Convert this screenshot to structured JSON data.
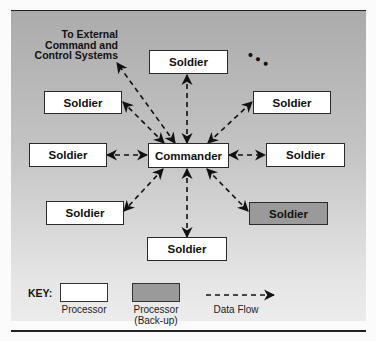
{
  "diagram": {
    "external_label_lines": [
      "To External",
      "Command and",
      "Control Systems"
    ],
    "ellipsis": "• • •",
    "nodes": {
      "commander": {
        "label": "Commander",
        "type": "processor"
      },
      "top": {
        "label": "Soldier",
        "type": "processor"
      },
      "upper_left": {
        "label": "Soldier",
        "type": "processor"
      },
      "upper_right": {
        "label": "Soldier",
        "type": "processor"
      },
      "left": {
        "label": "Soldier",
        "type": "processor"
      },
      "right": {
        "label": "Soldier",
        "type": "processor"
      },
      "lower_left": {
        "label": "Soldier",
        "type": "processor"
      },
      "lower_right": {
        "label": "Soldier",
        "type": "processor-backup"
      },
      "bottom": {
        "label": "Soldier",
        "type": "processor"
      }
    },
    "edges": [
      {
        "from": "commander",
        "to": "external-systems",
        "style": "dashed",
        "direction": "bidirectional"
      },
      {
        "from": "commander",
        "to": "top",
        "style": "dashed",
        "direction": "bidirectional"
      },
      {
        "from": "commander",
        "to": "upper_left",
        "style": "dashed",
        "direction": "bidirectional"
      },
      {
        "from": "commander",
        "to": "upper_right",
        "style": "dashed",
        "direction": "bidirectional"
      },
      {
        "from": "commander",
        "to": "left",
        "style": "dashed",
        "direction": "bidirectional"
      },
      {
        "from": "commander",
        "to": "right",
        "style": "dashed",
        "direction": "bidirectional"
      },
      {
        "from": "commander",
        "to": "lower_left",
        "style": "dashed",
        "direction": "bidirectional"
      },
      {
        "from": "commander",
        "to": "lower_right",
        "style": "dashed",
        "direction": "bidirectional"
      },
      {
        "from": "commander",
        "to": "bottom",
        "style": "dashed",
        "direction": "bidirectional"
      }
    ]
  },
  "key": {
    "title": "KEY:",
    "items": [
      {
        "label_lines": [
          "Processor"
        ],
        "swatch": "#ffffff"
      },
      {
        "label_lines": [
          "Processor",
          "(Back-up)"
        ],
        "swatch": "#9a9a9a"
      },
      {
        "label_lines": [
          "Data Flow"
        ],
        "swatch": "dashed-arrow"
      }
    ]
  },
  "colors": {
    "panel_top": "#ababab",
    "panel_bottom": "#ececec",
    "processor_fill": "#ffffff",
    "backup_fill": "#9a9a9a",
    "line": "#222222"
  }
}
